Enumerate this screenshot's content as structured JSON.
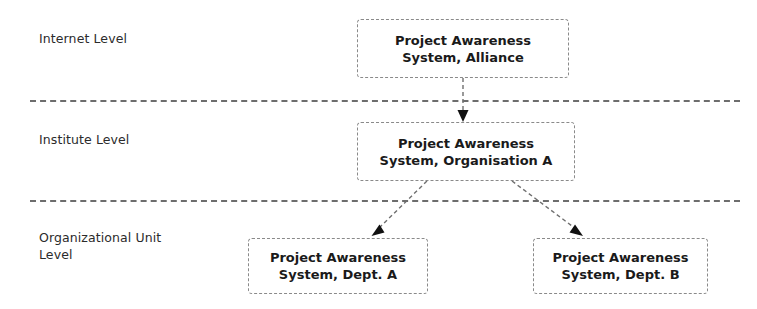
{
  "diagram": {
    "title_text_present": false,
    "levels": [
      {
        "id": "internet",
        "label": "Internet Level"
      },
      {
        "id": "institute",
        "label": "Institute Level"
      },
      {
        "id": "orgunit",
        "label": "Organizational Unit\nLevel"
      }
    ],
    "nodes": [
      {
        "id": "alliance",
        "label": "Project Awareness\nSystem, Alliance",
        "level": "internet"
      },
      {
        "id": "organisation",
        "label": "Project Awareness\nSystem, Organisation A",
        "level": "institute"
      },
      {
        "id": "dept_a",
        "label": "Project Awareness\nSystem, Dept. A",
        "level": "orgunit"
      },
      {
        "id": "dept_b",
        "label": "Project Awareness\nSystem, Dept. B",
        "level": "orgunit"
      }
    ],
    "connections": [
      {
        "id": "alliance-to-organisation",
        "from": "alliance",
        "to": "organisation",
        "style": "dashed-arrow",
        "direction": "down"
      },
      {
        "id": "organisation-to-dept-a",
        "from": "organisation",
        "to": "dept_a",
        "style": "dashed-arrow",
        "direction": "down-left"
      },
      {
        "id": "organisation-to-dept-b",
        "from": "organisation",
        "to": "dept_b",
        "style": "dashed-arrow",
        "direction": "down-right"
      }
    ],
    "colors": {
      "background": "#ffffff",
      "node_border": "#8a8a8a",
      "node_text": "#1a1a1a",
      "divider": "#6d6d6d",
      "connector": "#6f6f6f",
      "arrowhead": "#111111",
      "label_text": "#2b2b2b"
    }
  }
}
